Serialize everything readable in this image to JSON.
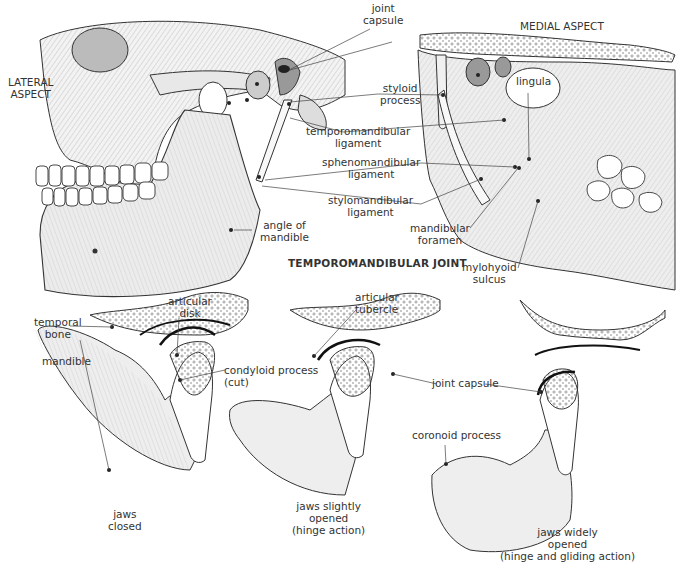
{
  "figure": {
    "title": "TEMPOROMANDIBULAR JOINT",
    "top_views": {
      "lateral": {
        "heading_line1": "LATERAL",
        "heading_line2": "ASPECT"
      },
      "medial": {
        "heading": "MEDIAL ASPECT"
      }
    },
    "labels": {
      "joint_capsule_top": [
        "joint",
        "capsule"
      ],
      "styloid_process": [
        "styloid",
        "process"
      ],
      "temporomandibular_ligament": [
        "temporomandibular",
        "ligament"
      ],
      "sphenomandibular_ligament": [
        "sphenomandibular",
        "ligament"
      ],
      "stylomandibular_ligament": [
        "stylomandibular",
        "ligament"
      ],
      "angle_of_mandible": [
        "angle of",
        "mandible"
      ],
      "lingula": [
        "lingula"
      ],
      "mandibular_foramen": [
        "mandibular",
        "foramen"
      ],
      "mylohyoid_sulcus": [
        "mylohyoid",
        "sulcus"
      ],
      "temporal_bone": [
        "temporal",
        "bone"
      ],
      "articular_disk": [
        "articular",
        "disk"
      ],
      "mandible": [
        "mandible"
      ],
      "condyloid_process": [
        "condyloid process",
        "(cut)"
      ],
      "articular_tubercle": [
        "articular",
        "tubercle"
      ],
      "joint_capsule_bottom": [
        "joint capsule"
      ],
      "coronoid_process": [
        "coronoid process"
      ]
    },
    "panels": [
      {
        "caption": [
          "jaws",
          "closed"
        ]
      },
      {
        "caption": [
          "jaws slightly",
          "opened",
          "(hinge action)"
        ]
      },
      {
        "caption": [
          "jaws  widely",
          "opened",
          "(hinge and gliding action)"
        ]
      }
    ],
    "colors": {
      "ink": "#2a2a2a",
      "bone_fill": "#ededed",
      "background": "#ffffff"
    }
  }
}
